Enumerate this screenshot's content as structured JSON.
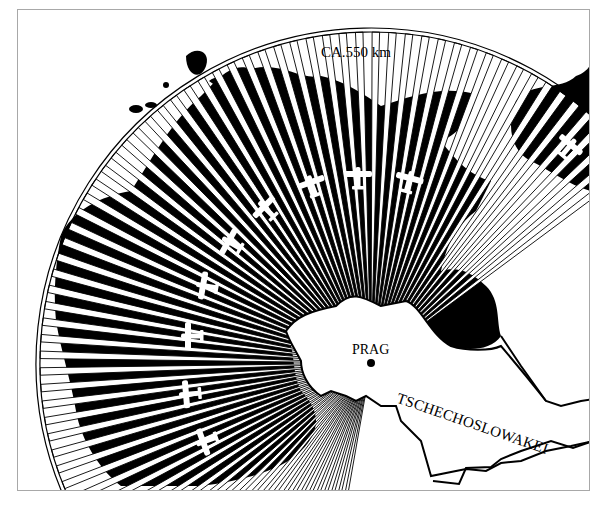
{
  "map": {
    "title": "",
    "range_label": "CA.550 km",
    "city_label": "PRAG",
    "country_label": "TSCHECHOSLOWAKEI",
    "colors": {
      "ink": "#000000",
      "paper": "#ffffff",
      "frame": "#a8a8a8"
    },
    "fan": {
      "center": [
        370,
        362
      ],
      "outer_radius": 335,
      "start_angle_deg": 100,
      "end_angle_deg": 325,
      "ray_count": 78
    },
    "planes": [
      {
        "name": "plane-1",
        "x": 205,
        "y": 440,
        "rot": -110
      },
      {
        "name": "plane-2",
        "x": 188,
        "y": 393,
        "rot": -95
      },
      {
        "name": "plane-3",
        "x": 190,
        "y": 335,
        "rot": -90
      },
      {
        "name": "plane-4",
        "x": 205,
        "y": 285,
        "rot": -80
      },
      {
        "name": "plane-5",
        "x": 230,
        "y": 242,
        "rot": -60
      },
      {
        "name": "plane-6",
        "x": 265,
        "y": 208,
        "rot": -45
      },
      {
        "name": "plane-7",
        "x": 311,
        "y": 184,
        "rot": -20
      },
      {
        "name": "plane-8",
        "x": 357,
        "y": 176,
        "rot": 0
      },
      {
        "name": "plane-9",
        "x": 408,
        "y": 180,
        "rot": 15
      },
      {
        "name": "plane-10",
        "x": 568,
        "y": 146,
        "rot": 40
      }
    ]
  }
}
